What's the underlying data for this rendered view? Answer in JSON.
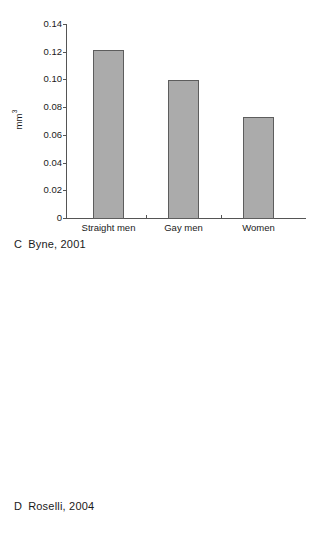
{
  "figure": {
    "background_color": "#ffffff",
    "bar_fill_color": "#ababab",
    "bar_edge_color": "#5d5d5d",
    "axis_color": "#555555",
    "text_color": "#1a1a1a"
  },
  "panels": [
    {
      "id": "C",
      "caption_letter": "C",
      "caption_text": "Byne, 2001"
    },
    {
      "id": "D",
      "caption_letter": "D",
      "caption_text": "Roselli, 2004"
    }
  ],
  "chart_data": [
    {
      "type": "bar",
      "panel": "C",
      "title": "",
      "xlabel": "",
      "ylabel": "mm",
      "ylabel_superscript": "3",
      "categories": [
        "Straight men",
        "Gay men",
        "Women"
      ],
      "values": [
        0.121,
        0.0995,
        0.073
      ],
      "ylim": [
        0,
        0.14
      ],
      "yticks": [
        0,
        0.02,
        0.04,
        0.06,
        0.08,
        0.1,
        0.12,
        0.14
      ],
      "ytick_labels": [
        "0",
        "0.02",
        "0.04",
        "0.06",
        "0.08",
        "0.10",
        "0.12",
        "0.14"
      ],
      "grid": false,
      "legend": "none"
    },
    {
      "type": "bar",
      "panel": "D",
      "title": "",
      "xlabel": "",
      "ylabel": "mm",
      "ylabel_superscript": "3",
      "categories": [
        "Heterosexual rams",
        "Homosexual rams",
        "Ewes"
      ],
      "category_lines": [
        [
          "Heterosexual",
          "rams"
        ],
        [
          "Homosexual",
          "rams"
        ],
        [
          "Ewes"
        ]
      ],
      "values": [
        0.328,
        0.2,
        0.128
      ],
      "ylim": [
        0,
        0.35
      ],
      "yticks": [
        0,
        0.05,
        0.1,
        0.15,
        0.2,
        0.25,
        0.3,
        0.35
      ],
      "ytick_labels": [
        "0",
        "0.05",
        "0.10",
        "0.15",
        "0.20",
        "0.25",
        "0.30",
        "0.35"
      ],
      "grid": false,
      "legend": "none"
    }
  ]
}
